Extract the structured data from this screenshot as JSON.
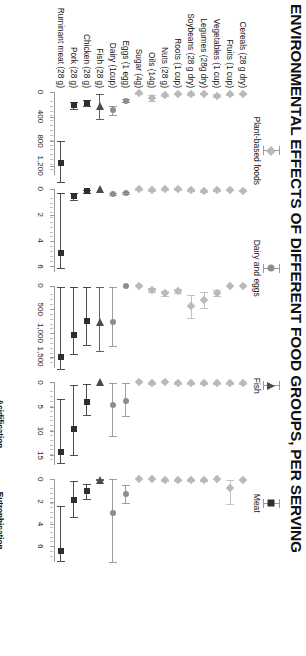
{
  "title": "ENVIRONMENTAL EFFECTS OF DIFFERENT FOOD GROUPS, PER SERVING",
  "legend": [
    {
      "label": "Plant-based foods",
      "marker": "diamond",
      "color": "#b9b9b9"
    },
    {
      "label": "Dairy and eggs",
      "marker": "circle",
      "color": "#8d8d8d"
    },
    {
      "label": "Fish",
      "marker": "triangle",
      "color": "#4a4a4a"
    },
    {
      "label": "Meat",
      "marker": "square",
      "color": "#2e2e2e"
    }
  ],
  "chart_data": {
    "type": "scatter",
    "title": "ENVIRONMENTAL EFFECTS OF DIFFERENT FOOD GROUPS, PER SERVING",
    "orientation": "horizontal-dot-with-error-bars",
    "grid": false,
    "legend_position": "top",
    "categories": [
      "Ruminant meat (28 g)",
      "Pork (28 g)",
      "Chicken (28 g)",
      "Fish (28 g)",
      "Dairy (1cup)",
      "Eggs (1 egg)",
      "Sugar (4g)",
      "Oils (14g)",
      "Nuts (28 g)",
      "Roots (1 cup)",
      "Soybeans (28 g dry)",
      "Legumes (28g dry)",
      "Vegetables (1 cup)",
      "Fruits (1 cup)",
      "Cereals (28 g dry)"
    ],
    "category_groups": [
      "Meat",
      "Meat",
      "Meat",
      "Fish",
      "Dairy and eggs",
      "Dairy and eggs",
      "Plant-based foods",
      "Plant-based foods",
      "Plant-based foods",
      "Plant-based foods",
      "Plant-based foods",
      "Plant-based foods",
      "Plant-based foods",
      "Plant-based foods",
      "Plant-based foods"
    ],
    "panels": [
      {
        "name": "greenhouse-gases",
        "xlabel": "Greenhouse gases",
        "unit": "(g CO₂-eq/serving)",
        "xlim": [
          0,
          1350
        ],
        "ticks": [
          0,
          400,
          800,
          1200
        ],
        "ticklabels": [
          "0",
          "400",
          "800",
          "1,200"
        ],
        "values": [
          1150,
          215,
          180,
          230,
          300,
          145,
          20,
          95,
          50,
          25,
          30,
          28,
          60,
          35,
          30
        ],
        "low": [
          800,
          155,
          135,
          30,
          235,
          120,
          12,
          45,
          38,
          18,
          20,
          20,
          38,
          25,
          22
        ],
        "high": [
          1470,
          275,
          225,
          445,
          370,
          170,
          30,
          150,
          65,
          34,
          42,
          38,
          85,
          48,
          40
        ]
      },
      {
        "name": "land-use",
        "xlabel": "Land use",
        "unit": "(m²/serving)",
        "xlim": [
          0,
          6.4
        ],
        "ticks": [
          0,
          2,
          4,
          6
        ],
        "ticklabels": [
          "0",
          "2",
          "4",
          "6"
        ],
        "values": [
          5.0,
          0.55,
          0.2,
          0.0,
          0.4,
          0.3,
          0.05,
          0.12,
          0.05,
          0.04,
          0.12,
          0.15,
          0.1,
          0.09,
          0.14
        ],
        "low": [
          0.3,
          0.35,
          0.12,
          0.0,
          0.32,
          0.22,
          0.03,
          0.08,
          0.03,
          0.03,
          0.08,
          0.1,
          0.07,
          0.06,
          0.09
        ],
        "high": [
          6.1,
          0.85,
          0.3,
          0.0,
          0.5,
          0.38,
          0.08,
          0.18,
          0.08,
          0.06,
          0.18,
          0.22,
          0.15,
          0.13,
          0.2
        ]
      },
      {
        "name": "energy-use",
        "xlabel": "Energy use",
        "unit": "(kJ/serving)",
        "xlim": [
          0,
          1750
        ],
        "ticks": [
          0,
          500,
          1000,
          1500
        ],
        "ticklabels": [
          "0",
          "500",
          "1,000",
          "1,500"
        ],
        "values": [
          1500,
          1050,
          750,
          760,
          760,
          0,
          0,
          90,
          160,
          110,
          430,
          300,
          160,
          0,
          0
        ],
        "low": [
          30,
          30,
          30,
          20,
          20,
          0,
          0,
          50,
          110,
          70,
          200,
          140,
          95,
          0,
          0
        ],
        "high": [
          1760,
          1450,
          1260,
          1380,
          1270,
          0,
          0,
          135,
          215,
          150,
          680,
          470,
          230,
          0,
          0
        ]
      },
      {
        "name": "acidification-potential",
        "xlabel": "Acidification\npotential",
        "unit": "(g SO₂-eq/serving)",
        "xlim": [
          0,
          17
        ],
        "ticks": [
          0,
          5,
          10,
          15
        ],
        "ticklabels": [
          "0",
          "5",
          "10",
          "15"
        ],
        "values": [
          14.2,
          9.5,
          4.0,
          0.0,
          4.6,
          3.8,
          0.0,
          0.15,
          0.0,
          0.2,
          0.2,
          0.2,
          0.2,
          0.2,
          0.2
        ],
        "low": [
          3.4,
          0.6,
          0.3,
          0.0,
          0.1,
          0.1,
          0.0,
          0.05,
          0.0,
          0.1,
          0.1,
          0.1,
          0.1,
          0.1,
          0.1
        ],
        "high": [
          16.5,
          15.0,
          6.7,
          0.0,
          11.0,
          7.0,
          0.0,
          0.3,
          0.0,
          0.35,
          0.35,
          0.35,
          0.35,
          0.35,
          0.35
        ]
      },
      {
        "name": "eutrophication-potential",
        "xlabel": "Eutrophication\npotential",
        "unit": "(g PO₄-eq/serving)",
        "xlim": [
          0,
          7.4
        ],
        "ticks": [
          0,
          2,
          4,
          6
        ],
        "ticklabels": [
          "0",
          "2",
          "4",
          "6"
        ],
        "values": [
          6.4,
          1.85,
          1.05,
          0.05,
          3.05,
          1.35,
          0.0,
          0.0,
          0.08,
          0.08,
          0.08,
          0.08,
          0.0,
          0.75,
          0.05
        ],
        "low": [
          2.4,
          0.2,
          0.45,
          0.0,
          0.0,
          0.55,
          0.0,
          0.0,
          0.04,
          0.04,
          0.04,
          0.04,
          0.0,
          0.05,
          0.02
        ],
        "high": [
          7.3,
          3.4,
          1.75,
          0.1,
          7.4,
          2.1,
          0.0,
          0.0,
          0.12,
          0.12,
          0.12,
          0.12,
          0.0,
          2.2,
          0.08
        ]
      }
    ]
  }
}
